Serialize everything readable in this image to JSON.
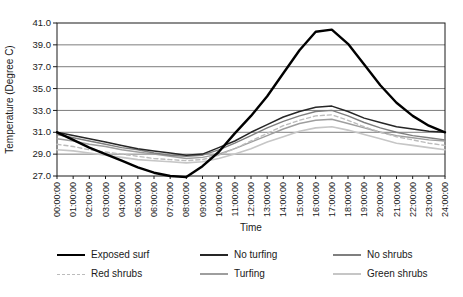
{
  "figure": {
    "background": "#ffffff",
    "axis_color": "#1a1a1a",
    "gridline_color": "#7d7d7d",
    "tick_label_color": "#1a1a1a"
  },
  "chart_data": {
    "type": "line",
    "title": "",
    "xlabel": "Time",
    "ylabel": "Temperature (Degree C)",
    "ylim": [
      27.0,
      41.0
    ],
    "ytick_step": 2.0,
    "ytick_labels": [
      "27.0",
      "29.0",
      "31.0",
      "33.0",
      "35.0",
      "37.0",
      "39.0",
      "41.0"
    ],
    "grid": "horizontal",
    "legend_position": "bottom",
    "categories": [
      "00:00:00",
      "01:00:00",
      "02:00:00",
      "03:00:00",
      "04:00:00",
      "05:00:00",
      "06:00:00",
      "07:00:00",
      "08:00:00",
      "09:00:00",
      "10:00:00",
      "11:00:00",
      "12:00:00",
      "13:00:00",
      "14:00:00",
      "15:00:00",
      "16:00:00",
      "17:00:00",
      "18:00:00",
      "19:00:00",
      "20:00:00",
      "21:00:00",
      "22:00:00",
      "23:00:00",
      "24:00:00"
    ],
    "series": [
      {
        "name": "Exposed surf",
        "color": "#000000",
        "width": 2.4,
        "dash": null,
        "values": [
          31.0,
          30.3,
          29.6,
          29.0,
          28.4,
          27.8,
          27.3,
          27.0,
          26.9,
          27.9,
          29.2,
          30.9,
          32.5,
          34.3,
          36.4,
          38.5,
          40.2,
          40.4,
          39.1,
          37.2,
          35.3,
          33.7,
          32.5,
          31.6,
          31.0
        ]
      },
      {
        "name": "No turfing",
        "color": "#262626",
        "width": 1.5,
        "dash": null,
        "values": [
          31.0,
          30.7,
          30.4,
          30.1,
          29.8,
          29.5,
          29.3,
          29.1,
          28.9,
          29.0,
          29.6,
          30.2,
          31.0,
          31.7,
          32.4,
          32.9,
          33.3,
          33.4,
          32.9,
          32.3,
          31.9,
          31.5,
          31.3,
          31.1,
          31.0
        ]
      },
      {
        "name": "No shrubs",
        "color": "#7f7f7f",
        "width": 1.4,
        "dash": null,
        "values": [
          30.8,
          30.5,
          30.2,
          29.9,
          29.6,
          29.4,
          29.1,
          28.9,
          28.8,
          28.9,
          29.4,
          30.0,
          30.7,
          31.4,
          32.0,
          32.5,
          32.9,
          33.0,
          32.5,
          31.9,
          31.4,
          31.0,
          30.7,
          30.5,
          30.3
        ]
      },
      {
        "name": "Red shrubs",
        "color": "#bcbcbc",
        "width": 1.4,
        "dash": "4,3",
        "values": [
          29.9,
          29.7,
          29.4,
          29.2,
          29.0,
          28.8,
          28.6,
          28.5,
          28.4,
          28.5,
          28.9,
          29.5,
          30.2,
          30.9,
          31.6,
          32.1,
          32.5,
          32.6,
          32.1,
          31.5,
          31.0,
          30.6,
          30.3,
          30.0,
          29.8
        ]
      },
      {
        "name": "Turfing",
        "color": "#9e9e9e",
        "width": 1.4,
        "dash": null,
        "values": [
          30.4,
          30.2,
          29.9,
          29.7,
          29.4,
          29.2,
          29.0,
          28.8,
          28.6,
          28.7,
          29.0,
          29.5,
          30.1,
          30.7,
          31.3,
          31.8,
          32.1,
          32.2,
          31.8,
          31.4,
          31.0,
          30.7,
          30.5,
          30.3,
          30.2
        ]
      },
      {
        "name": "Green shrubs",
        "color": "#c6c6c6",
        "width": 1.6,
        "dash": null,
        "values": [
          29.4,
          29.3,
          29.1,
          28.9,
          28.7,
          28.5,
          28.4,
          28.3,
          28.2,
          28.3,
          28.6,
          29.0,
          29.5,
          30.1,
          30.6,
          31.1,
          31.4,
          31.5,
          31.2,
          30.8,
          30.4,
          30.0,
          29.8,
          29.6,
          29.4
        ]
      }
    ]
  }
}
